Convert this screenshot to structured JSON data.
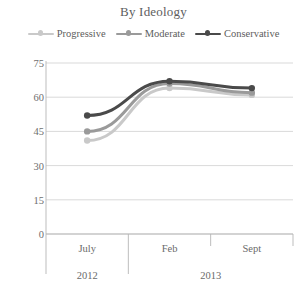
{
  "chart_data": {
    "type": "line",
    "title": "By Ideology",
    "xlabel": "",
    "ylabel": "",
    "ylim": [
      0,
      75
    ],
    "yticks": [
      0,
      15,
      30,
      45,
      60,
      75
    ],
    "grid": true,
    "legend_position": "top",
    "categories": [
      "July",
      "Feb",
      "Sept"
    ],
    "group_labels": [
      "2012",
      "2013"
    ],
    "group_spans": [
      [
        "July"
      ],
      [
        "Feb",
        "Sept"
      ]
    ],
    "series": [
      {
        "name": "Progressive",
        "values": [
          41,
          64,
          61
        ],
        "color": "#c9c9c9"
      },
      {
        "name": "Moderate",
        "values": [
          45,
          66,
          62
        ],
        "color": "#9a9a9a"
      },
      {
        "name": "Conservative",
        "values": [
          52,
          67,
          64
        ],
        "color": "#4a4a4a"
      }
    ]
  },
  "axis": {
    "ytick_labels": [
      "0",
      "15",
      "30",
      "45",
      "60",
      "75"
    ]
  },
  "legend": {
    "items": [
      {
        "label": "Progressive",
        "icon": "line-marker-icon"
      },
      {
        "label": "Moderate",
        "icon": "line-marker-icon"
      },
      {
        "label": "Conservative",
        "icon": "line-marker-icon"
      }
    ]
  },
  "colors": {
    "progressive": "#c9c9c9",
    "moderate": "#9a9a9a",
    "conservative": "#4a4a4a",
    "grid": "#cfcfcf",
    "axis": "#b5b5b5",
    "text": "#6a6a6a"
  }
}
